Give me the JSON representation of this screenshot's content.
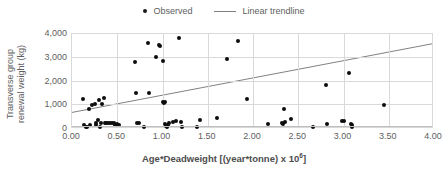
{
  "chart_data": {
    "type": "scatter",
    "title": "",
    "xlabel": "Age*Deadweight [(year*tonne) x 10⁶]",
    "ylabel": "Transverse group renewal weight (kg)",
    "xlim": [
      0,
      4.0
    ],
    "ylim": [
      0,
      4000
    ],
    "grid": true,
    "legend_position": "top-center",
    "series": [
      {
        "name": "Observed",
        "type": "scatter",
        "marker": "filled-circle",
        "color": "#0d0d0d",
        "points": [
          [
            0.12,
            1240
          ],
          [
            0.13,
            130
          ],
          [
            0.15,
            60
          ],
          [
            0.17,
            40
          ],
          [
            0.19,
            800
          ],
          [
            0.2,
            120
          ],
          [
            0.22,
            980
          ],
          [
            0.25,
            1000
          ],
          [
            0.26,
            210
          ],
          [
            0.27,
            120
          ],
          [
            0.29,
            330
          ],
          [
            0.3,
            1190
          ],
          [
            0.31,
            50
          ],
          [
            0.32,
            190
          ],
          [
            0.33,
            1010
          ],
          [
            0.35,
            1250
          ],
          [
            0.36,
            200
          ],
          [
            0.38,
            215
          ],
          [
            0.4,
            195
          ],
          [
            0.42,
            210
          ],
          [
            0.44,
            220
          ],
          [
            0.46,
            215
          ],
          [
            0.48,
            130
          ],
          [
            0.5,
            150
          ],
          [
            0.51,
            125
          ],
          [
            0.52,
            145
          ],
          [
            0.7,
            2770
          ],
          [
            0.71,
            1470
          ],
          [
            0.72,
            190
          ],
          [
            0.74,
            230
          ],
          [
            0.8,
            60
          ],
          [
            0.84,
            3600
          ],
          [
            0.85,
            1470
          ],
          [
            0.93,
            2980
          ],
          [
            0.96,
            3490
          ],
          [
            0.97,
            3470
          ],
          [
            1.0,
            2810
          ],
          [
            1.01,
            1080
          ],
          [
            1.02,
            1060
          ],
          [
            1.03,
            1100
          ],
          [
            1.03,
            180
          ],
          [
            1.04,
            95
          ],
          [
            1.05,
            60
          ],
          [
            1.06,
            130
          ],
          [
            1.07,
            230
          ],
          [
            1.12,
            270
          ],
          [
            1.15,
            300
          ],
          [
            1.18,
            3810
          ],
          [
            1.2,
            270
          ],
          [
            1.22,
            60
          ],
          [
            1.38,
            60
          ],
          [
            1.41,
            320
          ],
          [
            1.6,
            420
          ],
          [
            1.71,
            2890
          ],
          [
            1.83,
            3680
          ],
          [
            1.93,
            1210
          ],
          [
            2.17,
            150
          ],
          [
            2.32,
            225
          ],
          [
            2.33,
            180
          ],
          [
            2.34,
            810
          ],
          [
            2.35,
            265
          ],
          [
            2.42,
            370
          ],
          [
            2.66,
            60
          ],
          [
            2.81,
            1800
          ],
          [
            2.82,
            175
          ],
          [
            2.98,
            290
          ],
          [
            3.0,
            300
          ],
          [
            3.06,
            2300
          ],
          [
            3.08,
            170
          ],
          [
            3.09,
            50
          ],
          [
            3.09,
            110
          ],
          [
            3.45,
            960
          ]
        ]
      },
      {
        "name": "Linear trendline",
        "type": "line",
        "color": "#808080",
        "endpoints": [
          [
            0.0,
            620
          ],
          [
            4.0,
            3540
          ]
        ]
      }
    ],
    "x_ticks": [
      "0.00",
      "0.50",
      "1.00",
      "1.50",
      "2.00",
      "2.50",
      "3.00",
      "3.50",
      "4.00"
    ],
    "x_tick_values": [
      0,
      0.5,
      1.0,
      1.5,
      2.0,
      2.5,
      3.0,
      3.5,
      4.0
    ],
    "y_ticks": [
      "0",
      "1,000",
      "2,000",
      "3,000",
      "4,000"
    ],
    "y_tick_values": [
      0,
      1000,
      2000,
      3000,
      4000
    ]
  },
  "legend": {
    "observed_label": "Observed",
    "trendline_label": "Linear trendline"
  },
  "axes": {
    "y_title_line1": "Transverse group",
    "y_title_line2": "renewal weight (kg)",
    "x_title_main": "Age*Deadweight [(year*tonne) x 10",
    "x_title_exponent": "6",
    "x_title_tail": "]"
  },
  "colors": {
    "marker": "#0d0d0d",
    "trendline": "#808080",
    "gridline": "#d9d9d9",
    "text": "#5e5e5e"
  }
}
